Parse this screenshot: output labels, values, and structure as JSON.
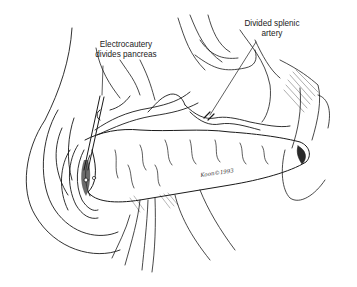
{
  "figure": {
    "type": "surgical-illustration",
    "style": "black-and-white pen and ink line drawing",
    "background_color": "#ffffff",
    "ink_color": "#1a1a1a"
  },
  "labels": {
    "electrocautery": {
      "line1": "Electrocautery",
      "line2": "divides pancreas"
    },
    "splenic_artery": {
      "line1": "Divided splenic",
      "line2": "artery"
    }
  },
  "signature": {
    "text": "Koon©1993"
  }
}
